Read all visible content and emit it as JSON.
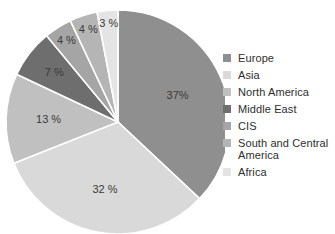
{
  "chart_data": {
    "type": "pie",
    "title": "",
    "categories": [
      "Europe",
      "Asia",
      "North America",
      "Middle East",
      "CIS",
      "South and Central America",
      "Africa"
    ],
    "values": [
      37,
      32,
      13,
      7,
      4,
      4,
      3
    ],
    "labels": [
      "37%",
      "32 %",
      "13 %",
      "7 %",
      "4 %",
      "4 %",
      "3 %"
    ],
    "colors": [
      "#8f8f8f",
      "#d9d9d9",
      "#c0c0c0",
      "#6e6e6e",
      "#a5a5a5",
      "#b5b5b5",
      "#e4e4e4"
    ],
    "start_angle_deg": 0,
    "direction": "clockwise",
    "legend_position": "right",
    "grid": false,
    "units": "percent"
  },
  "legend": {
    "items": [
      {
        "label": "Europe",
        "color": "#8f8f8f"
      },
      {
        "label": "Asia",
        "color": "#d9d9d9"
      },
      {
        "label": "North America",
        "color": "#c0c0c0"
      },
      {
        "label": "Middle East",
        "color": "#6e6e6e"
      },
      {
        "label": "CIS",
        "color": "#a5a5a5"
      },
      {
        "label": "South and Central America",
        "color": "#b5b5b5"
      },
      {
        "label": "Africa",
        "color": "#e4e4e4"
      }
    ]
  }
}
